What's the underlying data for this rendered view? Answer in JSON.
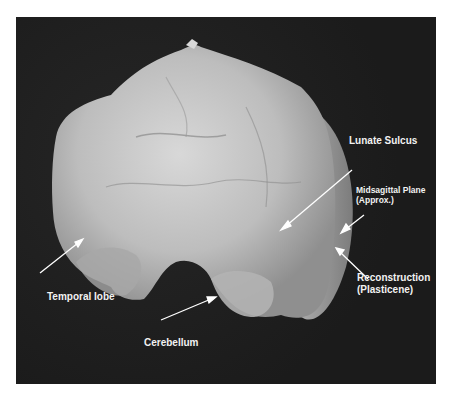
{
  "figure": {
    "background_color": "#1f1f1f",
    "labels": [
      {
        "id": "lunate-sulcus",
        "text": "Lunate Sulcus"
      },
      {
        "id": "midsagittal-plane",
        "line1": "Midsagittal Plane",
        "line2": "(Approx.)"
      },
      {
        "id": "reconstruction",
        "line1": "Reconstruction",
        "line2": "(Plasticene)"
      },
      {
        "id": "temporal-lobe",
        "text": "Temporal lobe"
      },
      {
        "id": "cerebellum",
        "text": "Cerebellum"
      }
    ],
    "arrow_color": "#ffffff"
  }
}
